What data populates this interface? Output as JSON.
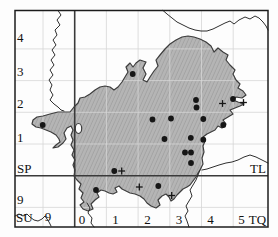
{
  "figure": {
    "type": "grid-distribution-map",
    "background": "#fdfdfd",
    "frame": {
      "x": 15,
      "y": 10.5,
      "width": 253,
      "height": 216.5,
      "stroke": "#1c1c1c",
      "stroke_width": 1.5
    },
    "grid": {
      "light_color": "#d6d6d6",
      "thick_color": "#3a3a3a",
      "vlines_light": [
        43,
        106.4,
        138.1,
        169.8,
        201.5,
        233.2
      ],
      "hlines_light": [
        48.9,
        80.6,
        112.3,
        144,
        207.4
      ],
      "vline_thick": 74.7,
      "hline_thick": 175.7
    },
    "region": {
      "fill": "#b5b5b5",
      "hatch_color": "#6e6e6e",
      "outline": "#3d3d3d",
      "outer": [
        [
          66,
          112
        ],
        [
          58,
          112
        ],
        [
          50,
          114
        ],
        [
          43,
          116
        ],
        [
          37,
          117
        ],
        [
          33,
          120
        ],
        [
          32,
          124
        ],
        [
          36,
          127
        ],
        [
          41,
          128
        ],
        [
          46,
          130
        ],
        [
          51,
          132
        ],
        [
          56,
          135
        ],
        [
          59,
          139
        ],
        [
          60,
          142
        ],
        [
          56,
          145
        ],
        [
          53,
          148
        ],
        [
          58,
          147
        ],
        [
          63,
          143
        ],
        [
          66,
          139
        ],
        [
          64,
          133
        ],
        [
          67,
          128
        ],
        [
          71,
          126
        ],
        [
          73,
          130
        ],
        [
          71,
          135
        ],
        [
          73,
          140
        ],
        [
          71,
          145
        ],
        [
          74,
          150
        ],
        [
          72,
          155
        ],
        [
          75,
          160
        ],
        [
          73,
          165
        ],
        [
          75,
          170
        ],
        [
          74,
          176
        ],
        [
          77,
          180
        ],
        [
          81,
          184
        ],
        [
          79,
          189
        ],
        [
          83,
          193
        ],
        [
          81,
          198
        ],
        [
          84,
          202
        ],
        [
          80,
          205
        ],
        [
          83,
          209
        ],
        [
          88,
          211
        ],
        [
          93,
          209
        ],
        [
          91,
          204
        ],
        [
          95,
          200
        ],
        [
          99,
          197
        ],
        [
          97,
          193
        ],
        [
          101,
          190
        ],
        [
          105,
          191
        ],
        [
          109,
          193
        ],
        [
          113,
          194
        ],
        [
          117,
          192
        ],
        [
          115,
          188
        ],
        [
          119,
          186
        ],
        [
          122,
          189
        ],
        [
          126,
          191
        ],
        [
          130,
          193
        ],
        [
          135,
          194
        ],
        [
          140,
          196
        ],
        [
          144,
          199
        ],
        [
          147,
          203
        ],
        [
          151,
          206
        ],
        [
          156,
          208
        ],
        [
          160,
          205
        ],
        [
          158,
          200
        ],
        [
          162,
          196
        ],
        [
          166,
          194
        ],
        [
          169,
          197
        ],
        [
          171,
          201
        ],
        [
          174,
          199
        ],
        [
          177,
          195
        ],
        [
          180,
          192
        ],
        [
          183,
          189
        ],
        [
          187,
          187
        ],
        [
          190,
          185
        ],
        [
          193,
          181
        ],
        [
          196,
          177
        ],
        [
          198,
          173
        ],
        [
          200,
          170
        ],
        [
          203,
          164
        ],
        [
          202,
          158
        ],
        [
          204,
          152
        ],
        [
          203,
          146
        ],
        [
          205,
          141
        ],
        [
          203,
          137
        ],
        [
          207,
          134
        ],
        [
          211,
          132
        ],
        [
          215,
          130
        ],
        [
          218,
          126
        ],
        [
          222,
          128
        ],
        [
          226,
          124
        ],
        [
          223,
          120
        ],
        [
          228,
          117
        ],
        [
          233,
          114
        ],
        [
          230,
          110
        ],
        [
          235,
          108
        ],
        [
          240,
          106
        ],
        [
          244,
          104
        ],
        [
          238,
          102
        ],
        [
          233,
          100
        ],
        [
          236,
          97
        ],
        [
          242,
          98
        ],
        [
          246,
          95
        ],
        [
          243,
          91
        ],
        [
          238,
          88
        ],
        [
          240,
          84
        ],
        [
          236,
          80
        ],
        [
          233,
          74
        ],
        [
          235,
          70
        ],
        [
          230,
          65
        ],
        [
          226,
          60
        ],
        [
          228,
          55
        ],
        [
          223,
          52
        ],
        [
          218,
          48
        ],
        [
          214,
          52
        ],
        [
          211,
          46
        ],
        [
          206,
          42
        ],
        [
          200,
          39
        ],
        [
          194,
          37
        ],
        [
          188,
          36
        ],
        [
          182,
          37
        ],
        [
          176,
          40
        ],
        [
          170,
          44
        ],
        [
          165,
          49
        ],
        [
          160,
          55
        ],
        [
          156,
          60
        ],
        [
          158,
          66
        ],
        [
          154,
          71
        ],
        [
          150,
          77
        ],
        [
          147,
          82
        ],
        [
          143,
          80
        ],
        [
          146,
          74
        ],
        [
          143,
          68
        ],
        [
          146,
          62
        ],
        [
          140,
          60
        ],
        [
          136,
          63
        ],
        [
          133,
          67
        ],
        [
          130,
          63
        ],
        [
          126,
          67
        ],
        [
          128,
          72
        ],
        [
          125,
          77
        ],
        [
          122,
          82
        ],
        [
          118,
          87
        ],
        [
          114,
          90
        ],
        [
          110,
          87
        ],
        [
          105,
          86
        ],
        [
          100,
          87
        ],
        [
          95,
          90
        ],
        [
          90,
          94
        ],
        [
          85,
          97
        ],
        [
          80,
          98
        ],
        [
          78,
          103
        ],
        [
          74,
          107
        ],
        [
          70,
          112
        ]
      ],
      "hole": {
        "cx": 78.5,
        "cy": 128.5,
        "rx": 3.2,
        "ry": 5
      }
    },
    "boundary_lines": {
      "color": "#2f2f2f",
      "width": 1,
      "lines": [
        [
          [
            58,
            10.5
          ],
          [
            61,
            15
          ],
          [
            57,
            20
          ],
          [
            60,
            25
          ],
          [
            55,
            30
          ],
          [
            57,
            35
          ],
          [
            53,
            40
          ],
          [
            56,
            45
          ],
          [
            52,
            50
          ],
          [
            55,
            55
          ],
          [
            51,
            60
          ],
          [
            54,
            65
          ],
          [
            50,
            70
          ],
          [
            53,
            75
          ],
          [
            49,
            80
          ],
          [
            52,
            85
          ],
          [
            50,
            90
          ],
          [
            53,
            95
          ],
          [
            50,
            100
          ],
          [
            54,
            104
          ],
          [
            58,
            107
          ],
          [
            61,
            110
          ],
          [
            64,
            111
          ]
        ],
        [
          [
            163,
            10.5
          ],
          [
            167,
            14
          ],
          [
            172,
            18
          ],
          [
            177,
            22
          ],
          [
            183,
            25
          ],
          [
            189,
            28
          ],
          [
            195,
            30
          ],
          [
            201,
            31
          ],
          [
            207,
            31
          ],
          [
            213,
            29
          ],
          [
            219,
            26
          ],
          [
            225,
            23
          ],
          [
            230,
            21
          ],
          [
            234,
            24
          ],
          [
            239,
            20
          ],
          [
            245,
            17
          ],
          [
            250,
            19
          ],
          [
            255,
            16
          ],
          [
            259,
            18
          ],
          [
            263,
            22
          ],
          [
            266,
            26
          ],
          [
            268,
            30
          ]
        ],
        [
          [
            268,
            163
          ],
          [
            262,
            160
          ],
          [
            256,
            157
          ],
          [
            250,
            155
          ],
          [
            244,
            157
          ],
          [
            238,
            160
          ],
          [
            232,
            162
          ],
          [
            226,
            163
          ],
          [
            219,
            165
          ],
          [
            213,
            167
          ],
          [
            207,
            169
          ],
          [
            202,
            170
          ]
        ],
        [
          [
            200,
            170
          ],
          [
            198,
            175
          ],
          [
            196,
            180
          ],
          [
            193,
            185
          ],
          [
            190,
            190
          ],
          [
            192,
            196
          ],
          [
            189,
            201
          ],
          [
            186,
            206
          ],
          [
            188,
            211
          ],
          [
            185,
            216
          ],
          [
            187,
            221
          ],
          [
            189,
            227
          ]
        ],
        [
          [
            15,
            216
          ],
          [
            19,
            214
          ],
          [
            23,
            216
          ],
          [
            27,
            214
          ],
          [
            30,
            217
          ],
          [
            34,
            220
          ],
          [
            38,
            221
          ],
          [
            42,
            219
          ],
          [
            45,
            216
          ],
          [
            47,
            219
          ],
          [
            49,
            222
          ],
          [
            51,
            226
          ]
        ],
        [
          [
            87,
            203
          ],
          [
            90,
            208
          ],
          [
            88,
            213
          ],
          [
            92,
            218
          ],
          [
            91,
            223
          ],
          [
            94,
            227
          ]
        ]
      ]
    },
    "markers": {
      "color": "#161616",
      "dot_radius": 2.9,
      "plus_half": 3.4,
      "plus_stroke": 1.3,
      "dots": [
        [
          42.7,
          125
        ],
        [
          132.7,
          74
        ],
        [
          196,
          100
        ],
        [
          196.5,
          107.5
        ],
        [
          233,
          99
        ],
        [
          152.5,
          119.5
        ],
        [
          171,
          118.5
        ],
        [
          203.3,
          119
        ],
        [
          223.3,
          125
        ],
        [
          164.5,
          139
        ],
        [
          190.8,
          137.8
        ],
        [
          203.3,
          139.7
        ],
        [
          185,
          152.5
        ],
        [
          191,
          152.5
        ],
        [
          191,
          163
        ],
        [
          114.3,
          171
        ],
        [
          96,
          190
        ],
        [
          158.3,
          186
        ]
      ],
      "plus": [
        [
          222.5,
          103.5
        ],
        [
          243.5,
          102.5
        ],
        [
          121.7,
          171
        ],
        [
          139.3,
          187
        ],
        [
          171.7,
          195.5
        ]
      ]
    },
    "labels": {
      "font_size": 13,
      "color": "#111111",
      "items": [
        {
          "text": "4",
          "x": 17,
          "y": 42,
          "anchor": "start",
          "name": "axis-label-northing-4"
        },
        {
          "text": "3",
          "x": 17,
          "y": 76,
          "anchor": "start",
          "name": "axis-label-northing-3"
        },
        {
          "text": "2",
          "x": 17,
          "y": 107.5,
          "anchor": "start",
          "name": "axis-label-northing-2"
        },
        {
          "text": "1",
          "x": 17,
          "y": 141.5,
          "anchor": "start",
          "name": "axis-label-northing-1"
        },
        {
          "text": "9",
          "x": 17,
          "y": 203.5,
          "anchor": "start",
          "name": "axis-label-northing-9"
        },
        {
          "text": "SP",
          "x": 17,
          "y": 172.5,
          "anchor": "start",
          "name": "grid-square-label-sp"
        },
        {
          "text": "SU",
          "x": 16,
          "y": 221.5,
          "anchor": "start",
          "name": "grid-square-label-su"
        },
        {
          "text": "TL",
          "x": 258,
          "y": 172.5,
          "anchor": "middle",
          "name": "grid-square-label-tl"
        },
        {
          "text": "TQ",
          "x": 257.5,
          "y": 223.5,
          "anchor": "middle",
          "name": "grid-square-label-tq"
        },
        {
          "text": "9",
          "x": 48,
          "y": 221,
          "anchor": "middle",
          "name": "axis-label-easting-9"
        },
        {
          "text": "0",
          "x": 82,
          "y": 223.5,
          "anchor": "middle",
          "name": "axis-label-easting-0"
        },
        {
          "text": "1",
          "x": 115.5,
          "y": 223.5,
          "anchor": "middle",
          "name": "axis-label-easting-1"
        },
        {
          "text": "2",
          "x": 147.5,
          "y": 223.5,
          "anchor": "middle",
          "name": "axis-label-easting-2"
        },
        {
          "text": "3",
          "x": 179,
          "y": 223.5,
          "anchor": "middle",
          "name": "axis-label-easting-3"
        },
        {
          "text": "4",
          "x": 210.5,
          "y": 223.5,
          "anchor": "middle",
          "name": "axis-label-easting-4"
        },
        {
          "text": "5",
          "x": 241.5,
          "y": 223.5,
          "anchor": "middle",
          "name": "axis-label-easting-5"
        }
      ]
    }
  }
}
